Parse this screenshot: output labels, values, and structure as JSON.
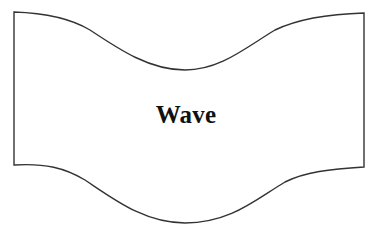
{
  "diagram": {
    "shape": {
      "type": "wave",
      "stroke_color": "#333333",
      "fill_color": "#ffffff",
      "label": "Wave"
    }
  }
}
